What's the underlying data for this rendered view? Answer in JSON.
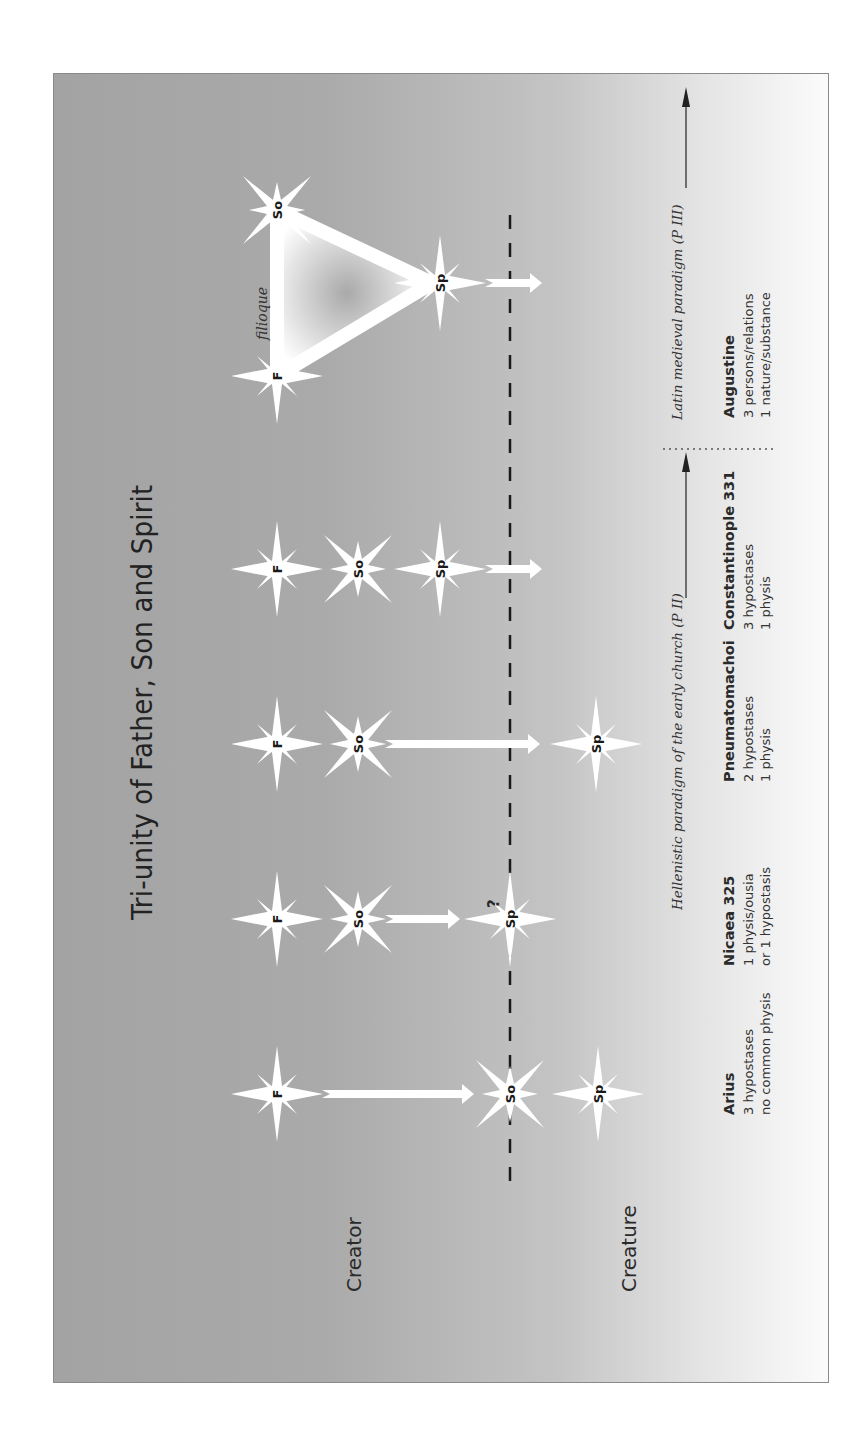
{
  "figure": {
    "title": "Tri-unity of Father, Son and Spirit",
    "labels": {
      "creator": "Creator",
      "creature": "Creature"
    },
    "filioque": "filioque",
    "question_mark": "?",
    "person_abbrev": {
      "father": "F",
      "son": "So",
      "spirit": "Sp"
    },
    "paradigms": [
      {
        "id": "p2",
        "label": "Hellenistic paradigm of the early church (P II)"
      },
      {
        "id": "p3",
        "label": "Latin medieval paradigm (P III)"
      }
    ],
    "positions": [
      {
        "id": "arius",
        "heading": "Arius",
        "lines": [
          "3 hypostases",
          "no common physis"
        ]
      },
      {
        "id": "nicaea",
        "heading": "Nicaea 325",
        "lines": [
          "1 physis/ousia",
          "or 1 hypostasis"
        ]
      },
      {
        "id": "pneumatomachoi",
        "heading": "Pneumatomachoi",
        "lines": [
          "2 hypostases",
          "1 physis"
        ]
      },
      {
        "id": "constantinople",
        "heading": "Constantinople 331",
        "lines": [
          "3 hypostases",
          "1 physis"
        ]
      },
      {
        "id": "augustine",
        "heading": "Augustine",
        "lines": [
          "3 persons/relations",
          "1 nature/substance"
        ]
      }
    ],
    "colors": {
      "background_dark": "#a3a3a3",
      "background_light": "#fbfbfb",
      "star": "#ffffff",
      "dash": "#1a1a1a",
      "frame": "#8a8a8a"
    }
  }
}
